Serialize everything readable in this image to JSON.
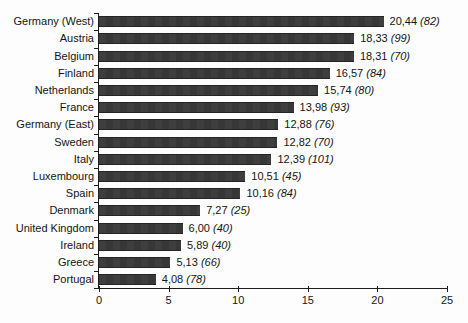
{
  "chart_data": {
    "type": "bar",
    "orientation": "horizontal",
    "title": "",
    "xlabel": "",
    "ylabel": "",
    "categories": [
      "Germany (West)",
      "Austria",
      "Belgium",
      "Finland",
      "Netherlands",
      "France",
      "Germany (East)",
      "Sweden",
      "Italy",
      "Luxembourg",
      "Spain",
      "Denmark",
      "United Kingdom",
      "Ireland",
      "Greece",
      "Portugal"
    ],
    "values": [
      20.44,
      18.33,
      18.31,
      16.57,
      15.74,
      13.98,
      12.88,
      12.82,
      12.39,
      10.51,
      10.16,
      7.27,
      6.0,
      5.89,
      5.13,
      4.08
    ],
    "value_labels": [
      "20,44",
      "18,33",
      "18,31",
      "16,57",
      "15,74",
      "13,98",
      "12,88",
      "12,82",
      "12,39",
      "10,51",
      "10,16",
      "7,27",
      "6,00",
      "5,89",
      "5,13",
      "4,08"
    ],
    "annotations": [
      "(82)",
      "(99)",
      "(70)",
      "(84)",
      "(80)",
      "(93)",
      "(76)",
      "(70)",
      "(101)",
      "(45)",
      "(84)",
      "(25)",
      "(40)",
      "(40)",
      "(66)",
      "(78)"
    ],
    "xlim": [
      0,
      25
    ],
    "x_ticks": [
      "0",
      "5",
      "10",
      "15",
      "20",
      "25"
    ],
    "x_tick_values": [
      0,
      5,
      10,
      15,
      20,
      25
    ],
    "grid": false,
    "legend": false,
    "bar_color": "#3b3b3b",
    "axis_color": "#1c1c1c",
    "text_color": "#141414",
    "background_color": "#fdfdfd"
  }
}
